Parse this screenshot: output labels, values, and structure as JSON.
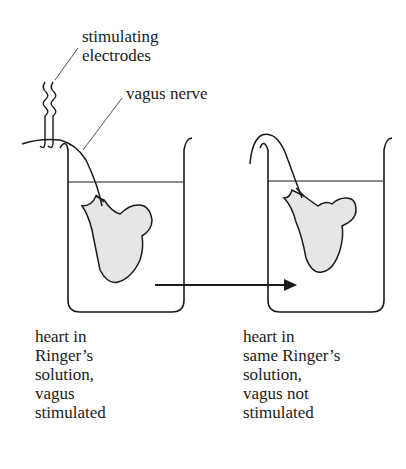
{
  "labels": {
    "electrodes": [
      "stimulating",
      "electrodes"
    ],
    "nerve": "vagus nerve"
  },
  "captions": {
    "left": [
      "heart in",
      "Ringer’s",
      "solution,",
      "vagus",
      "stimulated"
    ],
    "right": [
      "heart in",
      "same Ringer’s",
      "solution,",
      "vagus not",
      "stimulated"
    ]
  },
  "colors": {
    "ink": "#1a1a1a",
    "heart_fill": "#e6e6e6",
    "background": "#ffffff"
  }
}
